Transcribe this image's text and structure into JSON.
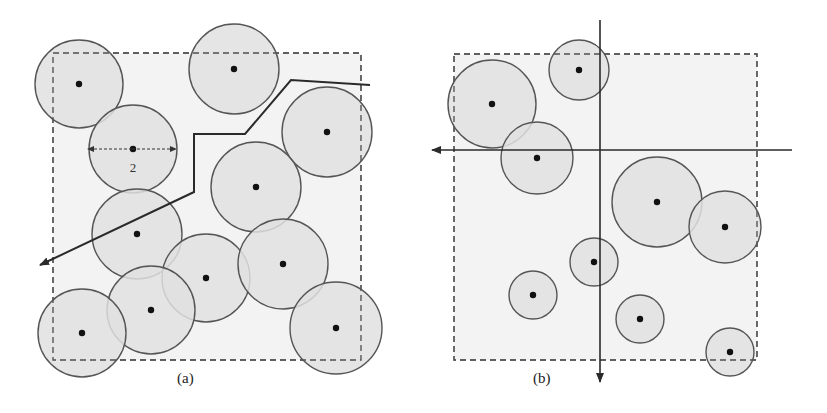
{
  "figure": {
    "background": "#ffffff",
    "region_fill": "#f3f3f3",
    "circle_fill": "#e1e1e1",
    "stroke": "#555555",
    "path_stroke": "#2a2a2a",
    "dot_color": "#111111"
  },
  "panel_a": {
    "caption": "(a)",
    "caption_pos": [
      177,
      378
    ],
    "region": {
      "x": 53,
      "y": 53,
      "w": 308,
      "h": 307
    },
    "nodes": [
      {
        "cx": 79,
        "cy": 84,
        "r": 44
      },
      {
        "cx": 234,
        "cy": 69,
        "r": 45
      },
      {
        "cx": 133,
        "cy": 149,
        "r": 44
      },
      {
        "cx": 327,
        "cy": 132,
        "r": 45
      },
      {
        "cx": 256,
        "cy": 187,
        "r": 45
      },
      {
        "cx": 137,
        "cy": 234,
        "r": 45
      },
      {
        "cx": 206,
        "cy": 278,
        "r": 44
      },
      {
        "cx": 283,
        "cy": 264,
        "r": 45
      },
      {
        "cx": 151,
        "cy": 310,
        "r": 44
      },
      {
        "cx": 82,
        "cy": 333,
        "r": 44
      },
      {
        "cx": 336,
        "cy": 328,
        "r": 46
      }
    ],
    "range_indicator": {
      "label": "2",
      "x1": 88,
      "x2": 176,
      "y": 149,
      "label_x": 133,
      "label_y": 172
    },
    "path": [
      [
        370,
        85
      ],
      [
        291,
        80
      ],
      [
        245,
        134
      ],
      [
        194,
        134
      ],
      [
        194,
        192
      ],
      [
        40,
        265
      ]
    ]
  },
  "panel_b": {
    "caption": "(b)",
    "caption_pos": [
      533,
      378
    ],
    "region": {
      "x": 454,
      "y": 54,
      "w": 303,
      "h": 306
    },
    "nodes": [
      {
        "cx": 579,
        "cy": 70,
        "r": 30
      },
      {
        "cx": 492,
        "cy": 104,
        "r": 44
      },
      {
        "cx": 537,
        "cy": 158,
        "r": 36
      },
      {
        "cx": 657,
        "cy": 202,
        "r": 45
      },
      {
        "cx": 725,
        "cy": 227,
        "r": 36
      },
      {
        "cx": 594,
        "cy": 262,
        "r": 24
      },
      {
        "cx": 533,
        "cy": 295,
        "r": 24
      },
      {
        "cx": 640,
        "cy": 319,
        "r": 24
      },
      {
        "cx": 730,
        "cy": 352,
        "r": 24
      }
    ],
    "axes": {
      "vertical": {
        "x": 600,
        "y1": 20,
        "y2": 382,
        "arrow": "down"
      },
      "horizontal": {
        "y": 150,
        "x1": 792,
        "x2": 432,
        "arrow": "left"
      }
    }
  }
}
